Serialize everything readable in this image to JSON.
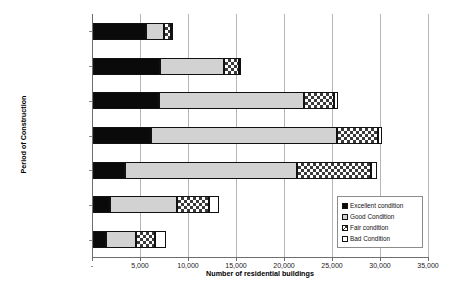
{
  "chart_data": {
    "type": "bar",
    "orientation": "horizontal",
    "stacked": true,
    "title": "",
    "xlabel": "Number of residential buildings",
    "ylabel": "Period of Construction",
    "xlim": [
      0,
      35000
    ],
    "xticks": [
      0,
      5000,
      10000,
      15000,
      20000,
      25000,
      30000,
      35000
    ],
    "xtick_labels": [
      "-",
      "5,000",
      "10,000",
      "15,000",
      "20,000",
      "25,000",
      "30,000",
      "35,000"
    ],
    "grid": true,
    "legend_position": "bottom-right",
    "categories": [
      "After 1991",
      "From 1982 to 1991",
      "From 1972 to 1981",
      "From 1962 to 1971",
      "From 1946 to 1961",
      "From 1919 to 1945",
      "Before 1919"
    ],
    "series": [
      {
        "name": "Excellent condition",
        "color": "#0a0a0a",
        "values": [
          5500,
          7000,
          6900,
          6000,
          3300,
          1800,
          1400
        ]
      },
      {
        "name": "Good Condition",
        "color": "#d2d2d2",
        "values": [
          1900,
          6600,
          15100,
          19400,
          17900,
          7000,
          3100
        ]
      },
      {
        "name": "Fair condition",
        "color": "#ffffff",
        "values": [
          700,
          1600,
          3100,
          4300,
          7800,
          3300,
          2000
        ]
      },
      {
        "name": "Bad Condition",
        "color": "#ffffff",
        "values": [
          100,
          200,
          400,
          400,
          600,
          1000,
          1100
        ]
      }
    ]
  },
  "legend": {
    "items": [
      {
        "label": "Excellent condition",
        "swatch": "excellent"
      },
      {
        "label": "Good Condition",
        "swatch": "good"
      },
      {
        "label": "Fair condition",
        "swatch": "fair"
      },
      {
        "label": "Bad Condition",
        "swatch": "bad"
      }
    ]
  }
}
